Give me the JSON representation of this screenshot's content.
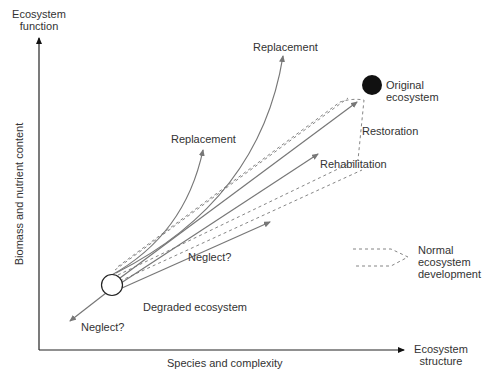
{
  "axes": {
    "y_title_line1": "Ecosystem",
    "y_title_line2": "function",
    "y_label": "Biomass and nutrient content",
    "x_title_line1": "Ecosystem",
    "x_title_line2": "structure",
    "x_label": "Species and complexity"
  },
  "nodes": {
    "original_line1": "Original",
    "original_line2": "ecosystem",
    "degraded": "Degraded ecosystem"
  },
  "pathways": {
    "replacement_upper": "Replacement",
    "replacement_lower": "Replacement",
    "restoration": "Restoration",
    "rehabilitation": "Rehabilitation",
    "neglect_upper": "Neglect?",
    "neglect_lower": "Neglect?"
  },
  "legend": {
    "line1": "Normal",
    "line2": "ecosystem",
    "line3": "development"
  },
  "colors": {
    "axis": "#222222",
    "arrow": "#777777",
    "text": "#333333",
    "original_fill": "#111111"
  }
}
